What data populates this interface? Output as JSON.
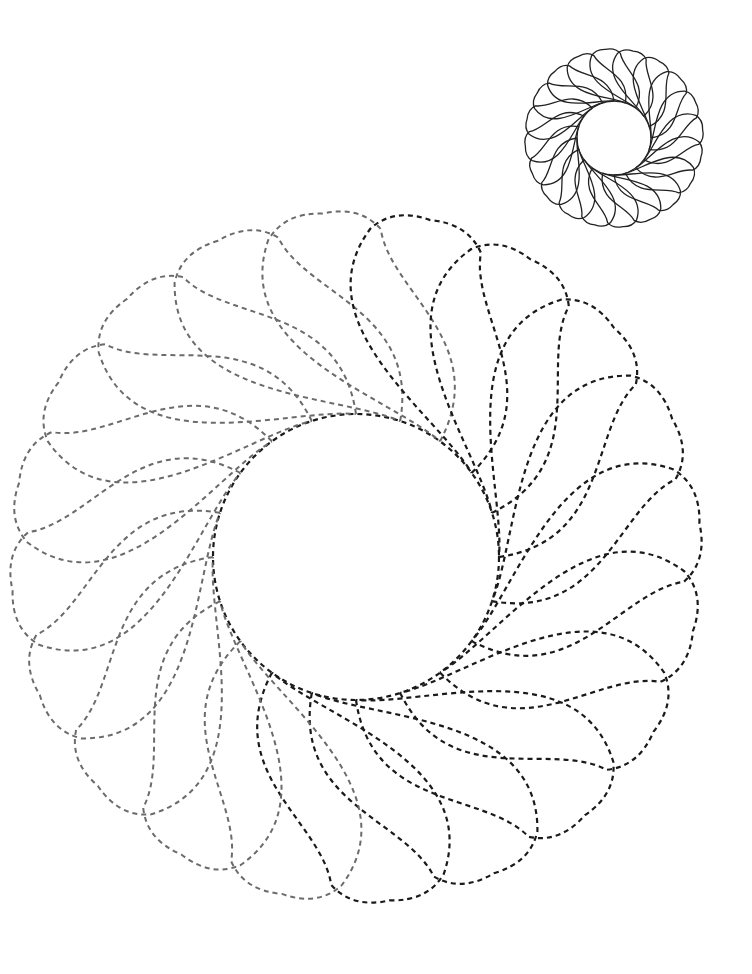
{
  "page": {
    "background": "#ffffff",
    "width": 752,
    "height": 974
  },
  "reference_rosette": {
    "label": "solid reference design",
    "cx": 614,
    "cy": 138,
    "inner_r": 37,
    "outer_r": 89,
    "petals": 20,
    "bulge": 0.62,
    "twist": 1.05,
    "stroke": "#222222"
  },
  "tracing_rosette": {
    "label": "dashed tracing design",
    "cx": 356,
    "cy": 557,
    "inner_r": 143,
    "outer_r": 345,
    "petals": 20,
    "bulge": 0.62,
    "twist": 1.05,
    "dark_stroke": "#1a1a1a",
    "light_stroke": "#6b6b6b",
    "light_sector_start_deg": 95,
    "light_sector_end_deg": 265
  }
}
